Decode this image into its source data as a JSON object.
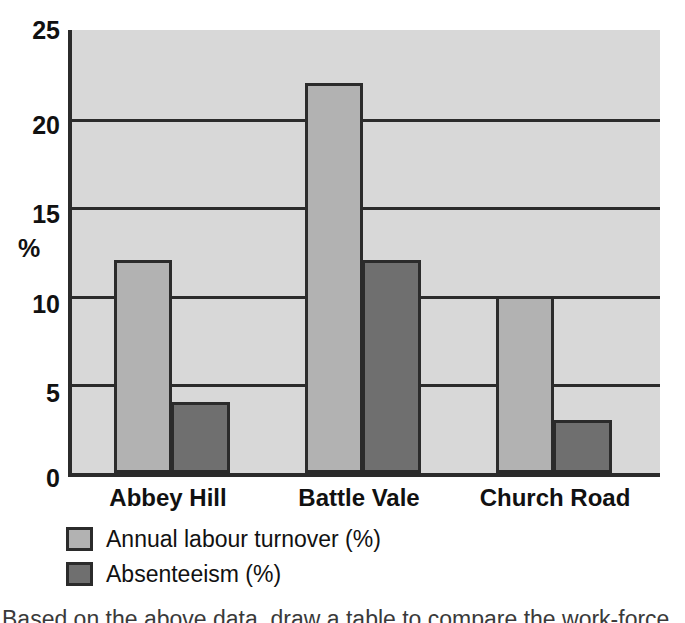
{
  "chart_data": {
    "type": "bar",
    "title": "",
    "xlabel": "",
    "ylabel": "%",
    "ylim": [
      0,
      25
    ],
    "ytick_values": [
      25,
      20,
      15,
      10,
      5,
      0
    ],
    "ytick_labels": [
      "25",
      "20",
      "15",
      "10",
      "5",
      "0"
    ],
    "grid": "horizontal",
    "gridline_values": [
      20,
      15,
      10,
      5
    ],
    "legend_position": "below-axis-left",
    "categories": [
      "Abbey Hill",
      "Battle Vale",
      "Church Road"
    ],
    "series": [
      {
        "name": "Annual labour turnover (%)",
        "color": "#b2b2b2",
        "values": [
          12,
          22,
          10
        ]
      },
      {
        "name": "Absenteeism (%)",
        "color": "#6f6f6f",
        "values": [
          4,
          12,
          3
        ]
      }
    ]
  },
  "colors": {
    "plot_background": "#d8d8d8",
    "axis": "#2b2b2b",
    "gridline": "#2b2b2b",
    "series_light": "#b2b2b2",
    "series_dark": "#6f6f6f",
    "page_background": "#ffffff",
    "text": "#111111"
  },
  "caption": {
    "clipped_line": "Based on the above data, draw a table to compare the work-force"
  }
}
